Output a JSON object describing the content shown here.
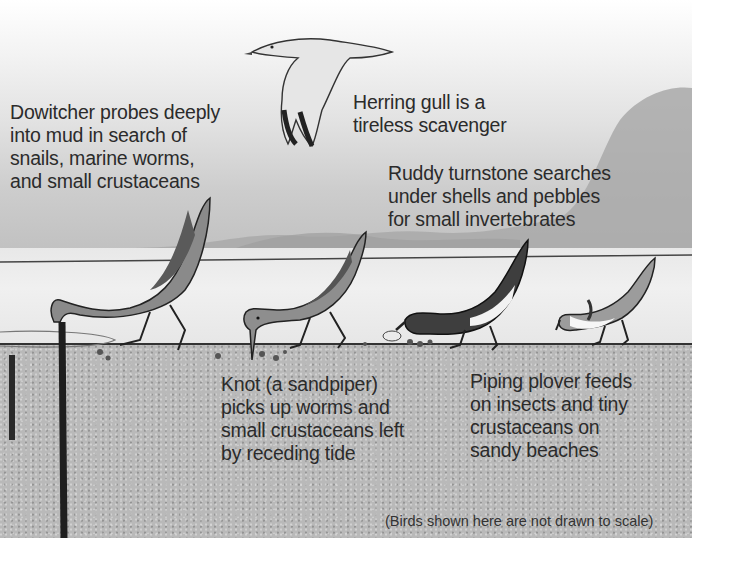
{
  "figure": {
    "background_colors": {
      "sky_top": "#ffffff",
      "sky_bottom": "#bdbdbd",
      "water": "#ececec",
      "sand": "#b9b9b9",
      "ink": "#2b2b2b"
    },
    "captions": {
      "dowitcher": "Dowitcher probes deeply\ninto mud in search of\nsnails, marine worms,\nand small crustaceans",
      "herring_gull": "Herring gull is a\ntireless scavenger",
      "ruddy_turnstone": "Ruddy turnstone searches\nunder shells and pebbles\nfor small invertebrates",
      "knot": "Knot (a sandpiper)\npicks up worms and\nsmall crustaceans left\nby receding tide",
      "piping_plover": "Piping plover feeds\non insects and tiny\ncrustaceans on\nsandy beaches"
    },
    "footnote": "(Birds shown here are not drawn to scale)",
    "birds": [
      {
        "name": "herring-gull",
        "pose": "flying"
      },
      {
        "name": "dowitcher",
        "pose": "probing mud"
      },
      {
        "name": "knot",
        "pose": "picking at sand"
      },
      {
        "name": "ruddy-turnstone",
        "pose": "flipping shell"
      },
      {
        "name": "piping-plover",
        "pose": "pecking"
      }
    ]
  }
}
